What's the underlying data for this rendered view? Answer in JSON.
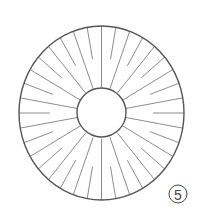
{
  "figure": {
    "type": "annular-disc-with-radial-spokes",
    "label": "5",
    "label_style": "circled-number",
    "colors": {
      "background": "#ffffff",
      "outline": "#555555",
      "spoke": "#8c8c8c",
      "label": "#444444"
    },
    "outer_ring": {
      "cx": 101.5,
      "cy": 113,
      "rx": 82.5,
      "ry": 87
    },
    "inner_ring": {
      "cx": 101.5,
      "cy": 112.5,
      "r": 24.5
    },
    "spokes": {
      "count": 36,
      "angle_step_deg": 10,
      "pattern": "alternating long/short",
      "long_start_radius_fraction": 0.0,
      "short_start_radius_fraction": 0.45
    },
    "label_badge": {
      "cx": 178,
      "cy": 194,
      "r": 9
    }
  }
}
